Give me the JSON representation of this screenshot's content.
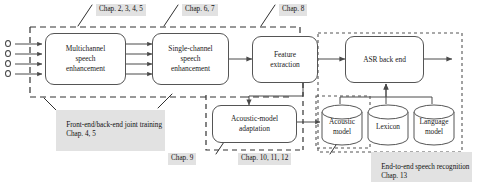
{
  "figure": {
    "domain": "diagram"
  },
  "nodes": {
    "multichannel": {
      "line1": "Multichannel",
      "line2": "speech",
      "line3": "enhancement"
    },
    "singlechannel": {
      "line1": "Single-channel",
      "line2": "speech",
      "line3": "enhancement"
    },
    "feature": {
      "line1": "Feature",
      "line2": "extraction"
    },
    "asr": {
      "line1": "ASR back end"
    },
    "adaptation": {
      "line1": "Acoustic-model",
      "line2": "adaptation"
    }
  },
  "databases": [
    {
      "name": "acoustic-model-db",
      "line1": "Acoustic",
      "line2": "model"
    },
    {
      "name": "lexicon-db",
      "line1": "Lexicon",
      "line2": ""
    },
    {
      "name": "language-model-db",
      "line1": "Language",
      "line2": "model"
    }
  ],
  "chapter_labels": [
    {
      "name": "chap-2-3-4-5",
      "text": "Chap. 2, 3, 4, 5"
    },
    {
      "name": "chap-6-7",
      "text": "Chap. 6, 7"
    },
    {
      "name": "chap-8",
      "text": "Chap. 8"
    },
    {
      "name": "chap-9",
      "text": "Chap. 9"
    },
    {
      "name": "chap-10-11-12",
      "text": "Chap. 10, 11, 12"
    }
  ],
  "region_labels": [
    {
      "name": "front-end-back-end-joint-training",
      "line1": "Front-end/back-end joint training",
      "line2": "Chap. 4, 5"
    },
    {
      "name": "end-to-end-speech-recognition",
      "line1": "End-to-end speech recognition",
      "line2": "Chap. 13"
    }
  ],
  "microphones": {
    "count": 4,
    "label": "microphone-array-input"
  },
  "colors": {
    "stroke": "#555555",
    "label_background": "#e2e2e2",
    "page_background": "#ffffff"
  }
}
